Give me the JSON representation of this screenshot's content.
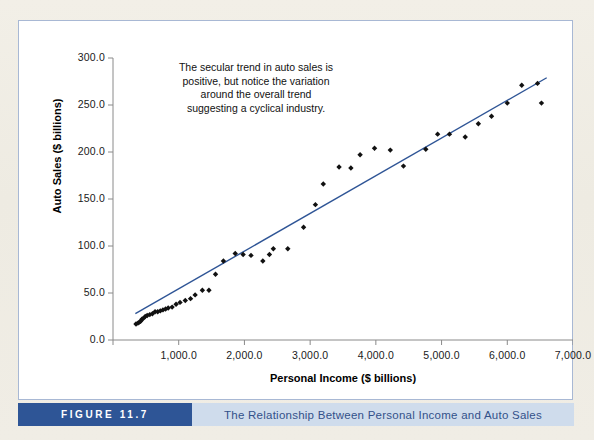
{
  "figure": {
    "number_label": "FIGURE 11.7",
    "caption": "The Relationship Between Personal Income and Auto Sales",
    "number_box_color": "#2e5596",
    "caption_box_color": "#cfdcec",
    "caption_text_color": "#33518a",
    "panel_border_color": "#a8b8d4",
    "page_background": "#efece3"
  },
  "annotation": {
    "line1": "The secular trend in auto sales is",
    "line2": "positive, but notice the variation",
    "line3": "around the overall trend",
    "line4": "suggesting a cyclical industry."
  },
  "chart_data": {
    "type": "scatter",
    "title": "The Relationship Between Personal Income and Auto Sales",
    "xlabel": "Personal Income ($ billions)",
    "ylabel": "Auto Sales ($ billions)",
    "xlim": [
      0,
      7000
    ],
    "ylim": [
      0,
      300
    ],
    "grid": false,
    "legend": false,
    "marker_color": "#111111",
    "marker_shape": "diamond",
    "trendline_color": "#2f5596",
    "axis_color": "#8a8a8a",
    "xticks": [
      0,
      1000,
      2000,
      3000,
      4000,
      5000,
      6000,
      7000
    ],
    "xticklabels": [
      "0.0",
      "1,000.0",
      "2,000.0",
      "3,000.0",
      "4,000.0",
      "5,000.0",
      "6,000.0",
      "7,000.0"
    ],
    "yticks": [
      0,
      50,
      100,
      150,
      200,
      250,
      300
    ],
    "yticklabels": [
      "0.0",
      "50.0",
      "100.0",
      "150.0",
      "200.0",
      "250.0",
      "300.0"
    ],
    "trendline": {
      "x0": 340,
      "y0": 28,
      "x1": 6600,
      "y1": 279
    },
    "annotation_text": "The secular trend in auto sales is positive, but notice the variation around the overall trend suggesting a cyclical industry.",
    "x": [
      350,
      380,
      400,
      420,
      440,
      460,
      490,
      520,
      560,
      600,
      640,
      680,
      720,
      760,
      800,
      840,
      900,
      960,
      1020,
      1100,
      1180,
      1250,
      1360,
      1460,
      1560,
      1680,
      1860,
      1980,
      2100,
      2280,
      2380,
      2440,
      2660,
      2900,
      3080,
      3200,
      3440,
      3620,
      3760,
      3980,
      4220,
      4420,
      4760,
      4940,
      5120,
      5360,
      5560,
      5760,
      6000,
      6220,
      6460,
      6520
    ],
    "y": [
      17,
      18,
      19,
      20,
      22,
      23,
      25,
      26,
      27,
      28,
      30,
      30,
      31,
      32,
      33,
      34,
      35,
      38,
      40,
      42,
      44,
      48,
      53,
      53,
      70,
      84,
      92,
      91,
      90,
      84,
      91,
      97,
      97,
      120,
      144,
      166,
      184,
      183,
      197,
      204,
      202,
      185,
      203,
      219,
      219,
      216,
      230,
      238,
      252,
      271,
      273,
      252
    ]
  }
}
